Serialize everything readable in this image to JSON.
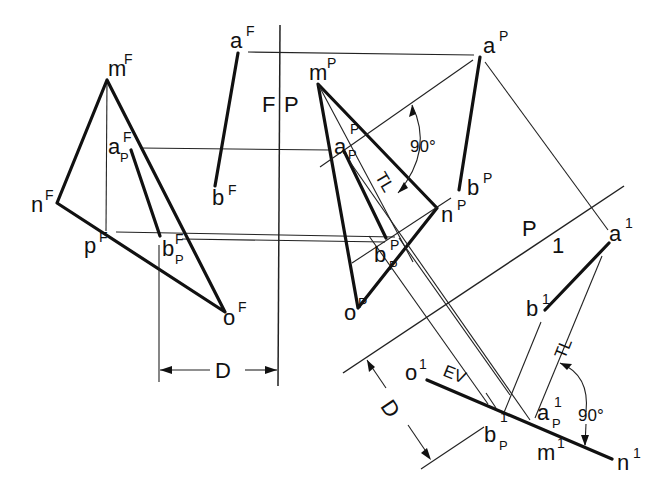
{
  "figure": {
    "type": "descriptive-geometry-auxiliary-views",
    "fold_lines": {
      "front_profile": {
        "left": "F",
        "right": "P"
      },
      "profile_aux": {
        "left": "P",
        "right": "1"
      }
    },
    "labels": {
      "aF": "a",
      "aF_sup": "F",
      "bF": "b",
      "bF_sup": "F",
      "mF": "m",
      "mF_sup": "F",
      "nF": "n",
      "nF_sup": "F",
      "oF": "o",
      "oF_sup": "F",
      "pF": "p",
      "pF_sup": "F",
      "apF": "a",
      "apF_sup": "F",
      "apF_sub": "P",
      "bpF": "b",
      "bpF_sup": "F",
      "bpF_sub": "P",
      "aP": "a",
      "aP_sup": "P",
      "bP": "b",
      "bP_sup": "P",
      "mP": "m",
      "mP_sup": "P",
      "nP": "n",
      "nP_sup": "P",
      "oP": "o",
      "oP_sup": "P",
      "apP": "a",
      "apP_sup": "P",
      "apP_sub": "P",
      "bpP": "b",
      "bpP_sup": "P",
      "bpP_sub": "P",
      "a1": "a",
      "a1_sup": "1",
      "b1": "b",
      "b1_sup": "1",
      "o1": "o",
      "o1_sup": "1",
      "m1": "m",
      "m1_sup": "1",
      "n1": "n",
      "n1_sup": "1",
      "ap1": "a",
      "ap1_sup": "1",
      "ap1_sub": "P",
      "bp1": "b",
      "bp1_sup": "1",
      "bp1_sub": "P"
    },
    "annotations": {
      "angle_top": "90°",
      "angle_bottom": "90°",
      "true_length_top": "TL",
      "true_length_bottom": "TL",
      "edge_view": "EV",
      "dimension_left": "D",
      "dimension_right": "D"
    }
  }
}
